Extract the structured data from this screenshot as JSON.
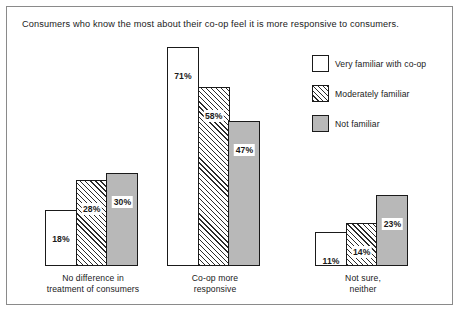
{
  "chart_data": {
    "type": "bar",
    "title": "Consumers who know the most about their co-op feel it is more responsive to consumers.",
    "xlabel": "",
    "ylabel": "",
    "ylim": [
      0,
      71
    ],
    "grid": false,
    "legend_position": "top-right",
    "value_suffix": "%",
    "categories": [
      "No difference in\ntreatment of consumers",
      "Co-op more\nresponsive",
      "Not sure,\nneither"
    ],
    "category_lines": [
      [
        "No difference in",
        "treatment of consumers"
      ],
      [
        "Co-op more",
        "responsive"
      ],
      [
        "Not sure,",
        "neither"
      ]
    ],
    "series": [
      {
        "name": "Very familiar with co-op",
        "fill": "white",
        "values": [
          18,
          71,
          11
        ],
        "labels": [
          "18%",
          "71%",
          "11%"
        ]
      },
      {
        "name": "Moderately familiar",
        "fill": "hatch",
        "values": [
          28,
          58,
          14
        ],
        "labels": [
          "28%",
          "58%",
          "14%"
        ]
      },
      {
        "name": "Not familiar",
        "fill": "gray",
        "values": [
          30,
          47,
          23
        ],
        "labels": [
          "30%",
          "47%",
          "23%"
        ]
      }
    ]
  },
  "legend": {
    "items": [
      {
        "label": "Very familiar with co-op",
        "fill": "white"
      },
      {
        "label": "Moderately familiar",
        "fill": "hatch"
      },
      {
        "label": "Not familiar",
        "fill": "gray"
      }
    ]
  },
  "colors": {
    "gray_fill": "#b8b8b8",
    "outline": "#1a1a1a",
    "frame": "#8a8a8a",
    "background": "#ffffff"
  }
}
